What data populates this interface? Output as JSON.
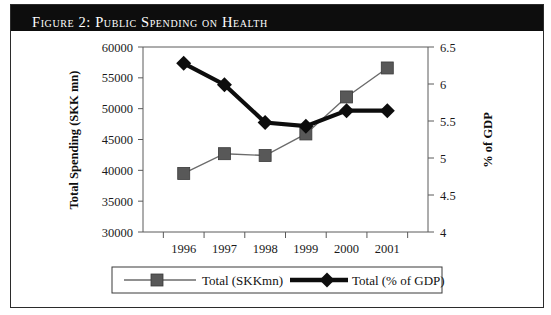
{
  "figure": {
    "title": "Figure 2:  Public Spending on Health"
  },
  "chart_data": {
    "type": "line",
    "title": "Figure 2:  Public Spending on Health",
    "xlabel": "",
    "categories": [
      "1996",
      "1997",
      "1998",
      "1999",
      "2000",
      "2001"
    ],
    "grid": false,
    "legend_position": "bottom",
    "axes": {
      "left": {
        "label": "Total Spending (SKK mn)",
        "min": 30000,
        "max": 60000,
        "step": 5000,
        "ticks": [
          "30000",
          "35000",
          "40000",
          "45000",
          "50000",
          "55000",
          "60000"
        ]
      },
      "right": {
        "label": "% of GDP",
        "min": 4,
        "max": 6.5,
        "step": 0.5,
        "ticks": [
          "4",
          "4.5",
          "5",
          "5.5",
          "6",
          "6.5"
        ]
      }
    },
    "series": [
      {
        "name": "Total (SKKmn)",
        "axis": "left",
        "marker": "square",
        "color": "#585858",
        "values": [
          39500,
          42700,
          42400,
          45900,
          51900,
          56600
        ]
      },
      {
        "name": "Total (% of GDP)",
        "axis": "right",
        "marker": "diamond",
        "color": "#0d0d0d",
        "values": [
          6.28,
          5.99,
          5.48,
          5.43,
          5.64,
          5.64
        ]
      }
    ]
  },
  "legend": {
    "items": [
      {
        "label": "Total (SKKmn)"
      },
      {
        "label": "Total (% of GDP)"
      }
    ]
  }
}
